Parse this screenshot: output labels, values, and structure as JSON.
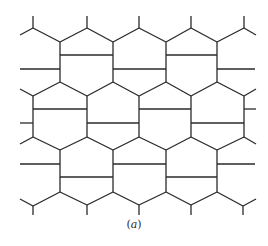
{
  "figure": {
    "caption_open": "(",
    "caption_letter": "a",
    "caption_close": ")",
    "line_color": "#2a2a2a",
    "background": "#ffffff"
  },
  "segments": [
    [
      33,
      16,
      33,
      28
    ],
    [
      33,
      28,
      20,
      35
    ],
    [
      33,
      28,
      60,
      42
    ],
    [
      87,
      16,
      87,
      28
    ],
    [
      87,
      28,
      60,
      42
    ],
    [
      87,
      28,
      113,
      42
    ],
    [
      139,
      16,
      139,
      28
    ],
    [
      139,
      28,
      113,
      42
    ],
    [
      139,
      28,
      166,
      42
    ],
    [
      191,
      16,
      191,
      28
    ],
    [
      191,
      28,
      166,
      42
    ],
    [
      191,
      28,
      217,
      42
    ],
    [
      244,
      16,
      244,
      28
    ],
    [
      244,
      28,
      217,
      42
    ],
    [
      244,
      28,
      256,
      35
    ],
    [
      60,
      42,
      60,
      82
    ],
    [
      113,
      42,
      113,
      82
    ],
    [
      166,
      42,
      166,
      82
    ],
    [
      217,
      42,
      217,
      82
    ],
    [
      60,
      55,
      113,
      55
    ],
    [
      166,
      55,
      217,
      55
    ],
    [
      20,
      69,
      60,
      69
    ],
    [
      113,
      69,
      166,
      69
    ],
    [
      217,
      69,
      255,
      69
    ],
    [
      60,
      82,
      33,
      96
    ],
    [
      60,
      82,
      87,
      96
    ],
    [
      113,
      82,
      87,
      96
    ],
    [
      113,
      82,
      139,
      96
    ],
    [
      166,
      82,
      139,
      96
    ],
    [
      166,
      82,
      191,
      96
    ],
    [
      217,
      82,
      191,
      96
    ],
    [
      217,
      82,
      244,
      96
    ],
    [
      33,
      96,
      20,
      89
    ],
    [
      244,
      96,
      256,
      89
    ],
    [
      33,
      96,
      33,
      137
    ],
    [
      87,
      96,
      87,
      137
    ],
    [
      139,
      96,
      139,
      137
    ],
    [
      191,
      96,
      191,
      137
    ],
    [
      244,
      96,
      244,
      137
    ],
    [
      33,
      109,
      87,
      109
    ],
    [
      139,
      109,
      191,
      109
    ],
    [
      244,
      109,
      256,
      109
    ],
    [
      20,
      123,
      33,
      123
    ],
    [
      87,
      123,
      139,
      123
    ],
    [
      191,
      123,
      244,
      123
    ],
    [
      33,
      137,
      20,
      144
    ],
    [
      33,
      137,
      60,
      150
    ],
    [
      87,
      137,
      60,
      150
    ],
    [
      87,
      137,
      113,
      150
    ],
    [
      139,
      137,
      113,
      150
    ],
    [
      139,
      137,
      166,
      150
    ],
    [
      191,
      137,
      166,
      150
    ],
    [
      191,
      137,
      217,
      150
    ],
    [
      244,
      137,
      217,
      150
    ],
    [
      244,
      137,
      256,
      144
    ],
    [
      60,
      150,
      60,
      192
    ],
    [
      113,
      150,
      113,
      192
    ],
    [
      166,
      150,
      166,
      192
    ],
    [
      217,
      150,
      217,
      192
    ],
    [
      20,
      164,
      60,
      164
    ],
    [
      113,
      164,
      166,
      164
    ],
    [
      217,
      164,
      255,
      164
    ],
    [
      60,
      177,
      113,
      177
    ],
    [
      166,
      177,
      217,
      177
    ],
    [
      20,
      199,
      33,
      206
    ],
    [
      33,
      206,
      60,
      192
    ],
    [
      33,
      206,
      33,
      215
    ],
    [
      60,
      192,
      87,
      205
    ],
    [
      113,
      192,
      87,
      205
    ],
    [
      87,
      205,
      87,
      215
    ],
    [
      113,
      192,
      139,
      205
    ],
    [
      166,
      192,
      139,
      205
    ],
    [
      139,
      205,
      139,
      215
    ],
    [
      166,
      192,
      191,
      205
    ],
    [
      217,
      192,
      191,
      205
    ],
    [
      191,
      205,
      191,
      215
    ],
    [
      217,
      192,
      243,
      206
    ],
    [
      243,
      206,
      256,
      199
    ],
    [
      243,
      206,
      243,
      215
    ]
  ]
}
